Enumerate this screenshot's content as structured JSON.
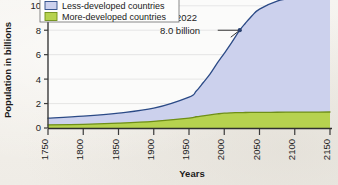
{
  "chart_data": {
    "type": "area",
    "title": "",
    "subtitle": "",
    "xlabel": "Years",
    "ylabel": "Population in billions",
    "xlim": [
      1750,
      2150
    ],
    "ylim": [
      0,
      10.8
    ],
    "xticks": [
      1750,
      1800,
      1850,
      1900,
      1950,
      2000,
      2050,
      2100,
      2150
    ],
    "xticklabels": [
      "1750",
      "1800",
      "1850",
      "1900",
      "1950",
      "2000",
      "2050",
      "2100",
      "2150"
    ],
    "yticks": [
      0,
      2,
      4,
      6,
      8,
      10
    ],
    "yticklabels": [
      "0",
      "2",
      "4",
      "6",
      "8",
      "10"
    ],
    "grid": "horizontal",
    "stacked": true,
    "legend_position": "top-left",
    "x": [
      1750,
      1800,
      1850,
      1900,
      1950,
      1960,
      1970,
      1980,
      1990,
      2000,
      2010,
      2022,
      2030,
      2040,
      2050,
      2075,
      2100,
      2125,
      2150
    ],
    "series": [
      {
        "name": "More-developed countries",
        "color": "#b6d24f",
        "line_color": "#6f8f18",
        "values": [
          0.25,
          0.3,
          0.4,
          0.55,
          0.81,
          0.92,
          1.0,
          1.08,
          1.15,
          1.21,
          1.24,
          1.26,
          1.27,
          1.28,
          1.28,
          1.29,
          1.3,
          1.3,
          1.31
        ]
      },
      {
        "name": "Less-developed countries",
        "color": "#ccd1ed",
        "line_color": "#2b4a86",
        "values": [
          0.55,
          0.67,
          0.82,
          1.07,
          1.72,
          2.08,
          2.7,
          3.35,
          4.15,
          4.9,
          5.7,
          6.74,
          7.3,
          7.95,
          8.45,
          9.1,
          9.35,
          9.45,
          9.5
        ]
      }
    ],
    "total_label": "Total world population",
    "annotation": {
      "year_label": "2022",
      "value_label": "8.0 billion",
      "point_x": 2022,
      "point_y": 8.0
    }
  },
  "legend": {
    "items": [
      {
        "label": "Less-developed countries",
        "swatch": "#ccd1ed",
        "swatch_border": "#2b4a86"
      },
      {
        "label": "More-developed countries",
        "swatch": "#b6d24f",
        "swatch_border": "#6f8f18"
      }
    ]
  },
  "colors": {
    "background": "#f3f1ec",
    "plot_background": "#fbfbfa",
    "axis": "#3a3a3a",
    "grid": "#d9d9d9",
    "less_developed_fill": "#ccd1ed",
    "less_developed_line": "#2b4a86",
    "more_developed_fill": "#b6d24f",
    "more_developed_line": "#6f8f18"
  }
}
